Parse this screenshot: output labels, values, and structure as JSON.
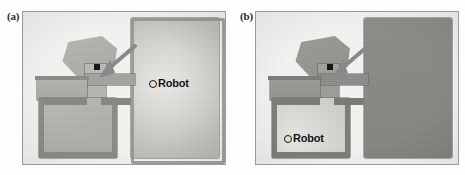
{
  "figure": {
    "background_color": "#fdfdfd",
    "panel_count": 2,
    "frame_border_color": "#9a9a9a",
    "frame_background_color": "#f6f5f3"
  },
  "panels": [
    {
      "id": "a",
      "label": "(a)",
      "robot": {
        "label": "Robot",
        "marker": "open-circle",
        "x_pct": 63,
        "y_pct": 48
      },
      "annotation": {
        "arrow": "diagonal-arrow-pointing-down-left",
        "target": "black-doorway-cell",
        "target_color": "#141414"
      },
      "colors": {
        "bright_region": "#e3e1dd",
        "mid_region": "#b6b4b0",
        "dark_region": "#8e8c88",
        "wall": "#6f6d6a"
      },
      "description_regions": [
        "large-right-room-bright-radial-gradient",
        "upper-left-angled-room",
        "lower-left-room",
        "connecting-corridor"
      ]
    },
    {
      "id": "b",
      "label": "(b)",
      "robot": {
        "label": "Robot",
        "marker": "open-circle",
        "x_pct": 20,
        "y_pct": 82
      },
      "annotation": {
        "arrow": "diagonal-arrow-pointing-down-left",
        "target": "black-doorway-cell",
        "target_color": "#141414"
      },
      "colors": {
        "bright_region": "#dedcd8",
        "mid_region": "#b0aeaa",
        "dark_region": "#848280",
        "wall": "#6a6866"
      },
      "description_regions": [
        "large-right-room-uniform-dark",
        "upper-left-angled-room",
        "lower-left-room-bright",
        "connecting-corridor"
      ]
    }
  ]
}
